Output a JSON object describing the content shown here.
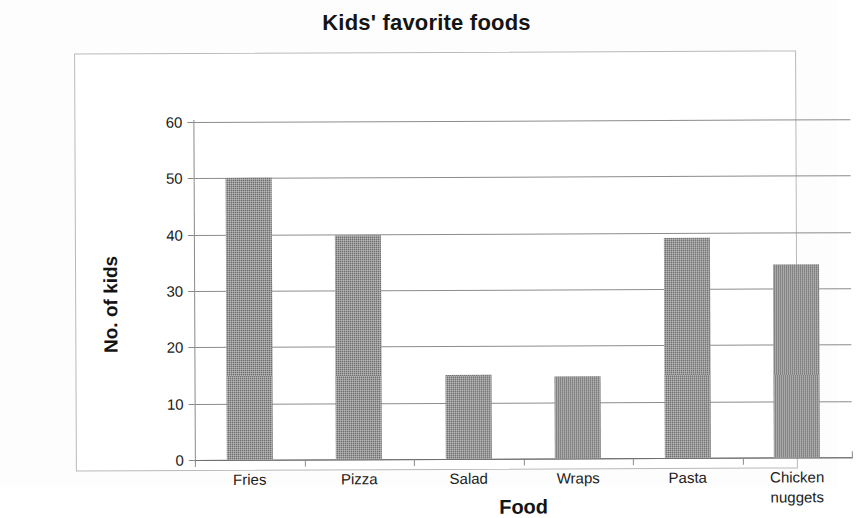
{
  "chart_data": {
    "type": "bar",
    "title": "Kids' favorite foods",
    "xlabel": "Food",
    "ylabel": "No. of kids",
    "categories": [
      "Fries",
      "Pizza",
      "Salad",
      "Wraps",
      "Pasta",
      "Chicken nuggets"
    ],
    "category_lines": [
      [
        "Fries"
      ],
      [
        "Pizza"
      ],
      [
        "Salad"
      ],
      [
        "Wraps"
      ],
      [
        "Pasta"
      ],
      [
        "Chicken",
        "nuggets"
      ]
    ],
    "values": [
      50,
      39.7,
      15,
      14.6,
      39.1,
      34.3
    ],
    "ylim": [
      0,
      60
    ],
    "ytick_step": 10,
    "yticks": [
      0,
      10,
      20,
      30,
      40,
      50,
      60
    ],
    "ytick_labels": [
      "0",
      "10",
      "20",
      "30",
      "40",
      "50",
      "60"
    ],
    "grid": true,
    "legend": false,
    "series": [
      {
        "name": "No. of kids",
        "values": [
          50,
          39.7,
          15,
          14.6,
          39.1,
          34.3
        ],
        "color": "#6e6e6e"
      }
    ]
  },
  "colors": {
    "bar_fill": "#6e6e6e",
    "gridline": "#8c8c8c",
    "axis": "#8a8a8a",
    "frame_border": "#b9b9b9",
    "text": "#141414",
    "background": "#ffffff"
  }
}
